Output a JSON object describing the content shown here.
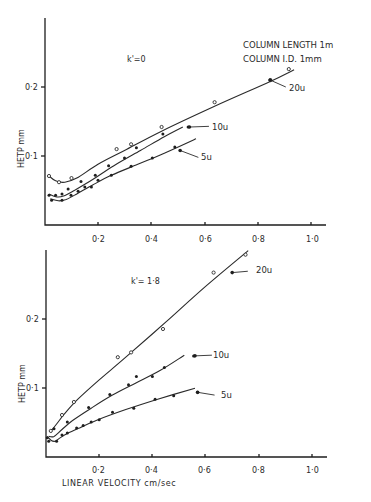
{
  "chart_data": [
    {
      "type": "scatter",
      "panel": "top",
      "title": "",
      "annotation": "k' = 0",
      "annotation_text_label": "k'=0",
      "note_lines": [
        "COLUMN LENGTH   1m",
        "COLUMN I.D. 1mm"
      ],
      "xlabel": "",
      "ylabel": "HETP  mm",
      "xlim": [
        0,
        1.05
      ],
      "ylim": [
        0,
        0.27
      ],
      "xticks": [
        0.2,
        0.4,
        0.6,
        0.8,
        1.0
      ],
      "xtick_labels": [
        "0·2",
        "0·4",
        "0·6",
        "0·8",
        "1·0"
      ],
      "yticks": [
        0.1,
        0.2
      ],
      "ytick_labels": [
        "0·1",
        "0·2"
      ],
      "grid": false,
      "legend": "inline labels with leader lines",
      "series": [
        {
          "name": "20u",
          "label": "20u",
          "marker": "open",
          "x": [
            0.015,
            0.053,
            0.1,
            0.27,
            0.325,
            0.44,
            0.64,
            0.85,
            0.92
          ],
          "y": [
            0.071,
            0.062,
            0.068,
            0.11,
            0.117,
            0.142,
            0.178,
            0.21,
            0.226
          ],
          "curve_x": [
            0.015,
            0.04,
            0.075,
            0.12,
            0.2,
            0.3,
            0.44,
            0.64,
            0.85,
            0.94
          ],
          "curve_y": [
            0.071,
            0.064,
            0.062,
            0.068,
            0.088,
            0.108,
            0.136,
            0.172,
            0.208,
            0.225
          ],
          "label_pos": [
            0.92,
            0.2
          ],
          "leader_to": [
            0.85,
            0.21
          ]
        },
        {
          "name": "10u",
          "label": "10u",
          "marker": "filled",
          "x": [
            0.015,
            0.04,
            0.064,
            0.087,
            0.136,
            0.19,
            0.24,
            0.3,
            0.345,
            0.445,
            0.54
          ],
          "y": [
            0.043,
            0.043,
            0.045,
            0.052,
            0.063,
            0.072,
            0.086,
            0.097,
            0.112,
            0.132,
            0.142
          ],
          "curve_x": [
            0.015,
            0.04,
            0.07,
            0.11,
            0.18,
            0.26,
            0.36,
            0.45,
            0.52
          ],
          "curve_y": [
            0.045,
            0.041,
            0.042,
            0.05,
            0.066,
            0.086,
            0.108,
            0.128,
            0.142
          ],
          "label_pos": [
            0.63,
            0.143
          ],
          "leader_to": [
            0.545,
            0.142
          ]
        },
        {
          "name": "5u",
          "label": "5u",
          "marker": "filled",
          "x": [
            0.025,
            0.064,
            0.098,
            0.125,
            0.15,
            0.175,
            0.2,
            0.25,
            0.325,
            0.405,
            0.49
          ],
          "y": [
            0.036,
            0.036,
            0.043,
            0.049,
            0.055,
            0.055,
            0.065,
            0.072,
            0.085,
            0.097,
            0.113
          ],
          "curve_x": [
            0.02,
            0.05,
            0.08,
            0.12,
            0.18,
            0.25,
            0.35,
            0.45,
            0.57
          ],
          "curve_y": [
            0.038,
            0.035,
            0.037,
            0.045,
            0.058,
            0.072,
            0.088,
            0.104,
            0.125
          ],
          "label_pos": [
            0.59,
            0.098
          ],
          "leader_to": [
            0.51,
            0.108
          ]
        }
      ]
    },
    {
      "type": "scatter",
      "panel": "bottom",
      "title": "",
      "annotation": "k' = 1.8",
      "annotation_text_label": "k'= 1·8",
      "xlabel": "LINEAR VELOCITY  cm/sec",
      "ylabel": "HETP  mm",
      "xlim": [
        0,
        1.05
      ],
      "ylim": [
        0,
        0.3
      ],
      "xticks": [
        0.2,
        0.4,
        0.6,
        0.8,
        1.0
      ],
      "xtick_labels": [
        "0·2",
        "0·4",
        "0·6",
        "0·8",
        "1·0"
      ],
      "yticks": [
        0.1,
        0.2
      ],
      "ytick_labels": [
        "0·1",
        "0·2"
      ],
      "grid": false,
      "legend": "inline labels with leader lines",
      "series": [
        {
          "name": "20u",
          "label": "20u",
          "marker": "open",
          "x": [
            0.018,
            0.06,
            0.105,
            0.27,
            0.32,
            0.44,
            0.63,
            0.75
          ],
          "y": [
            0.038,
            0.061,
            0.08,
            0.145,
            0.152,
            0.186,
            0.268,
            0.294
          ],
          "curve_x": [
            0.015,
            0.04,
            0.07,
            0.12,
            0.2,
            0.3,
            0.45,
            0.6,
            0.76
          ],
          "curve_y": [
            0.036,
            0.048,
            0.063,
            0.084,
            0.112,
            0.145,
            0.196,
            0.248,
            0.3
          ],
          "label_pos": [
            0.77,
            0.27
          ],
          "leader_to": [
            0.7,
            0.268
          ]
        },
        {
          "name": "10u",
          "label": "10u",
          "marker": "filled",
          "x": [
            0.005,
            0.03,
            0.08,
            0.16,
            0.24,
            0.31,
            0.34,
            0.4,
            0.445,
            0.555
          ],
          "y": [
            0.028,
            0.041,
            0.051,
            0.072,
            0.091,
            0.105,
            0.117,
            0.117,
            0.13,
            0.147
          ],
          "curve_x": [
            0.01,
            0.03,
            0.06,
            0.1,
            0.17,
            0.25,
            0.34,
            0.43,
            0.52
          ],
          "curve_y": [
            0.03,
            0.03,
            0.04,
            0.053,
            0.071,
            0.09,
            0.108,
            0.126,
            0.148
          ],
          "label_pos": [
            0.635,
            0.148
          ],
          "leader_to": [
            0.56,
            0.147
          ]
        },
        {
          "name": "5u",
          "label": "5u",
          "marker": "filled",
          "x": [
            0.01,
            0.04,
            0.06,
            0.08,
            0.115,
            0.14,
            0.17,
            0.2,
            0.25,
            0.33,
            0.41,
            0.48,
            0.57
          ],
          "y": [
            0.023,
            0.023,
            0.032,
            0.035,
            0.042,
            0.046,
            0.051,
            0.054,
            0.065,
            0.071,
            0.084,
            0.089,
            0.094
          ],
          "curve_x": [
            0.005,
            0.02,
            0.035,
            0.05,
            0.08,
            0.13,
            0.2,
            0.3,
            0.42,
            0.56
          ],
          "curve_y": [
            0.03,
            0.024,
            0.023,
            0.027,
            0.034,
            0.043,
            0.055,
            0.069,
            0.084,
            0.1
          ],
          "label_pos": [
            0.645,
            0.09
          ],
          "leader_to": [
            0.57,
            0.094
          ]
        }
      ]
    }
  ],
  "panels": {
    "top": {
      "k_label": "k'=0",
      "note_line1": "COLUMN LENGTH   1m",
      "note_line2": "COLUMN I.D. 1mm",
      "ylabel": "HETP  mm",
      "ytick_01": "0·1",
      "ytick_02": "0·2",
      "xtick_02": "0·2",
      "xtick_04": "0·4",
      "xtick_06": "0·6",
      "xtick_08": "0·8",
      "xtick_10": "1·0",
      "label_20u": "20u",
      "label_10u": "10u",
      "label_5u": "5u"
    },
    "bottom": {
      "k_label": "k'= 1·8",
      "ylabel": "HETP  mm",
      "xlabel": "LINEAR VELOCITY  cm/sec",
      "ytick_01": "0·1",
      "ytick_02": "0·2",
      "xtick_02": "0·2",
      "xtick_04": "0·4",
      "xtick_06": "0·6",
      "xtick_08": "0·8",
      "xtick_10": "1·0",
      "label_20u": "20u",
      "label_10u": "10u",
      "label_5u": "5u"
    }
  }
}
